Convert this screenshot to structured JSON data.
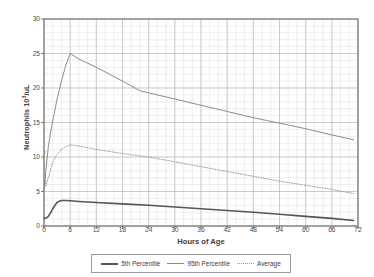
{
  "chart_data": {
    "type": "line",
    "title": "",
    "xlabel": "Hours of Age",
    "ylabel": "Neutrophils 10³/uL",
    "ylabel_prefix": "Neutrophils 10",
    "ylabel_exponent": "3",
    "ylabel_suffix": "/uL",
    "xlim": [
      0,
      72
    ],
    "ylim": [
      0,
      30
    ],
    "x_ticks": [
      0,
      6,
      12,
      18,
      24,
      30,
      36,
      42,
      48,
      54,
      60,
      66,
      72
    ],
    "y_ticks": [
      0,
      5,
      10,
      15,
      20,
      25,
      30
    ],
    "x_minor_step": 2,
    "y_minor_step": 1,
    "grid": true,
    "legend_position": "bottom",
    "colors": {
      "p5": "#555555",
      "p95": "#8c8c8c",
      "avg": "#9a9a9a",
      "grid_major": "#bcbcbc",
      "grid_minor": "#e2e2e2",
      "axis": "#6e6e6e",
      "text": "#3c3c3c"
    },
    "series": [
      {
        "name": "5th Percentile",
        "style": "solid-thick",
        "color": "#555555",
        "x": [
          0,
          0.5,
          1,
          1.5,
          2,
          2.5,
          3,
          3.5,
          4,
          5,
          6,
          8,
          12,
          18,
          24,
          30,
          36,
          42,
          48,
          54,
          60,
          66,
          71
        ],
        "y": [
          1.1,
          1.15,
          1.4,
          1.9,
          2.5,
          3.0,
          3.4,
          3.6,
          3.7,
          3.7,
          3.65,
          3.55,
          3.4,
          3.2,
          3.0,
          2.75,
          2.5,
          2.25,
          2.0,
          1.7,
          1.4,
          1.1,
          0.8
        ]
      },
      {
        "name": "95th Percentile",
        "style": "solid-thin",
        "color": "#8c8c8c",
        "x": [
          0,
          0.5,
          1,
          1.5,
          2,
          3,
          4,
          5,
          6,
          8,
          12,
          18,
          22,
          24,
          30,
          36,
          42,
          48,
          54,
          60,
          66,
          71
        ],
        "y": [
          5.0,
          8.5,
          11.5,
          13.5,
          15.2,
          18.4,
          21.0,
          23.3,
          25.0,
          24.2,
          23.0,
          21.0,
          19.6,
          19.3,
          18.4,
          17.5,
          16.6,
          15.7,
          14.9,
          14.1,
          13.2,
          12.5
        ]
      },
      {
        "name": "Average",
        "style": "dotted",
        "color": "#9a9a9a",
        "x": [
          0,
          0.4,
          1,
          1.5,
          2,
          3,
          4,
          5,
          6,
          7,
          8,
          12,
          18,
          24,
          30,
          36,
          42,
          48,
          54,
          60,
          66,
          71
        ],
        "y": [
          10.8,
          5.8,
          7.0,
          8.2,
          9.2,
          10.4,
          11.1,
          11.5,
          11.75,
          11.7,
          11.6,
          11.1,
          10.5,
          10.0,
          9.3,
          8.6,
          7.9,
          7.2,
          6.5,
          5.9,
          5.3,
          4.7
        ]
      }
    ],
    "annotations": [
      {
        "name": "average-origin-segment",
        "x": [
          0,
          0.35
        ],
        "y": [
          10.8,
          10.75
        ],
        "style": "solid-thin",
        "color": "#9a9a9a"
      }
    ]
  },
  "legend": {
    "items": [
      {
        "label": "5th Percentile",
        "swatch": "solid-thick-line-swatch"
      },
      {
        "label": "95th Percentile",
        "swatch": "solid-thin-line-swatch"
      },
      {
        "label": "Average",
        "swatch": "dotted-line-swatch"
      }
    ]
  }
}
